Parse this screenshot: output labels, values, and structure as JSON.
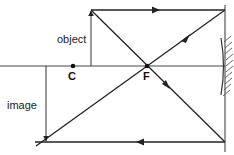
{
  "diagram": {
    "type": "ray-diagram-concave-mirror",
    "labels": {
      "object": "object",
      "image": "image",
      "center": "C",
      "focus": "F"
    },
    "colors": {
      "line": "#222222",
      "background": "#ffffff"
    },
    "geometry": {
      "axis_y": 66,
      "center_x": 73,
      "focus_x": 147,
      "mirror_x": 225,
      "object_x": 91,
      "object_top_y": 10,
      "image_x": 46,
      "image_bottom_y": 142
    }
  }
}
